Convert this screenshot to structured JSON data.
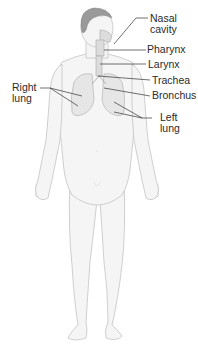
{
  "diagram": {
    "labels": {
      "nasal_cavity": {
        "line1": "Nasal",
        "line2": "cavity"
      },
      "pharynx": "Pharynx",
      "larynx": "Larynx",
      "trachea": "Trachea",
      "bronchus": "Bronchus",
      "right_lung": {
        "line1": "Right",
        "line2": "lung"
      },
      "left_lung": {
        "line1": "Left",
        "line2": "lung"
      }
    },
    "colors": {
      "leader_line": "#333333",
      "label_text": "#2a2a2a",
      "body_outline": "#c8c8c8",
      "body_fill": "#f4f4f4",
      "lung_fill": "#e6e6e6",
      "hair": "#8a8a8a"
    }
  }
}
